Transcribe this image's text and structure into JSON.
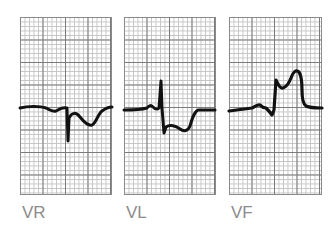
{
  "leads": [
    {
      "label": "VR",
      "description": "Lead aVR ECG trace"
    },
    {
      "label": "VL",
      "description": "Lead aVL ECG trace"
    },
    {
      "label": "VF",
      "description": "Lead aVF ECG trace"
    }
  ],
  "colors": {
    "trace": "#111111",
    "grid_major": "#7a7a7a",
    "grid_minor": "#c4c4c4",
    "label": "#8c8c8c",
    "background": "#ffffff"
  }
}
